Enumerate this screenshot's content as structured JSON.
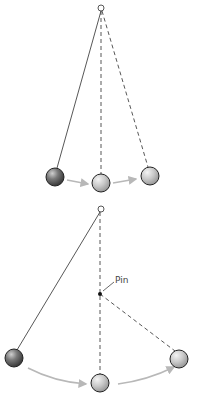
{
  "diagram": {
    "top_panel": {
      "pivot": {
        "x": 101,
        "y": 8
      },
      "balls": [
        {
          "x": 55,
          "y": 177,
          "r": 9,
          "fill": "#777777",
          "role": "start"
        },
        {
          "x": 101,
          "y": 183,
          "r": 9,
          "fill": "#c8c8c8",
          "role": "middle"
        },
        {
          "x": 150,
          "y": 176,
          "r": 9,
          "fill": "#c8c8c8",
          "role": "end"
        }
      ]
    },
    "bottom_panel": {
      "pivot": {
        "x": 101,
        "y": 209
      },
      "pin": {
        "x": 100,
        "y": 294,
        "label": "Pin"
      },
      "balls": [
        {
          "x": 14,
          "y": 358,
          "r": 9,
          "fill": "#777777",
          "role": "start"
        },
        {
          "x": 100,
          "y": 383,
          "r": 9,
          "fill": "#c8c8c8",
          "role": "middle"
        },
        {
          "x": 179,
          "y": 359,
          "r": 9,
          "fill": "#c8c8c8",
          "role": "end"
        }
      ]
    },
    "colors": {
      "line": "#444444",
      "arrow": "#b8b8b8"
    }
  }
}
